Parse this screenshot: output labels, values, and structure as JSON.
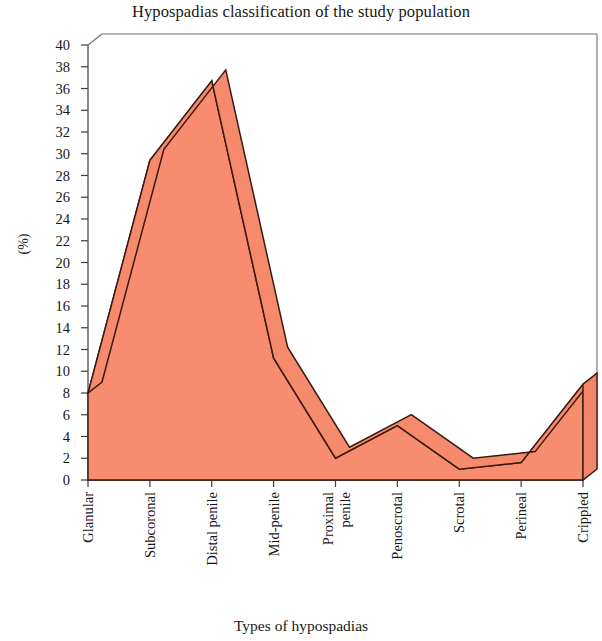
{
  "chart_data": {
    "type": "area",
    "title": "Hypospadias classification of the study population",
    "xlabel": "Types of hypospadias",
    "ylabel": "(%)",
    "categories": [
      "Glanular",
      "Subcoronal",
      "Distal penile",
      "Mid-penile",
      "Proximal penile",
      "Penoscrotal",
      "Scrotal",
      "Perineal",
      "Crippled"
    ],
    "values": [
      8,
      29.4,
      36.7,
      11.2,
      2,
      5,
      1,
      1.6,
      8.8
    ],
    "ylim": [
      0,
      40
    ],
    "ytick_labels": [
      "40",
      "38",
      "36",
      "34",
      "32",
      "30",
      "28",
      "26",
      "24",
      "22",
      "20",
      "18",
      "16",
      "14",
      "12",
      "10",
      "8",
      "6",
      "4",
      "2",
      "0"
    ],
    "ytick_step": 2,
    "grid": false,
    "legend": "none",
    "series_color": "#f68a6d",
    "series_outline_color": "#3a1a10",
    "style": "3d-area"
  },
  "axes": {
    "x_tick_labels_rotation": "vertical",
    "category_label_lines": [
      [
        "Glanular"
      ],
      [
        "Subcoronal"
      ],
      [
        "Distal penile"
      ],
      [
        "Mid-penile"
      ],
      [
        "Proximal",
        "penile"
      ],
      [
        "Penoscrotal"
      ],
      [
        "Scrotal"
      ],
      [
        "Perineal"
      ],
      [
        "Crippled"
      ]
    ]
  }
}
